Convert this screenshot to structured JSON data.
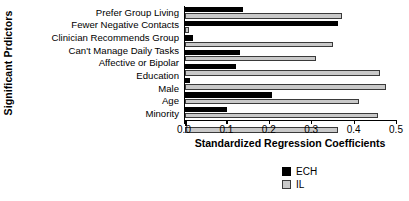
{
  "chart_data": {
    "type": "bar",
    "orientation": "horizontal",
    "title": "",
    "xlabel": "Standardized Regression Coefficients",
    "ylabel": "Significant Prdictors",
    "xlim": [
      0.0,
      0.5
    ],
    "xticks": [
      "0.0",
      "0.1",
      "0.2",
      "0.3",
      "0.4",
      "0.5"
    ],
    "xtick_values": [
      0.0,
      0.1,
      0.2,
      0.3,
      0.4,
      0.5
    ],
    "grid": false,
    "legend_position": "bottom-right",
    "categories": [
      "Prefer Group Living",
      "Fewer Negative Contacts",
      "Clinician Recommends Group",
      "Can't Manage Daily Tasks",
      "Affective or Bipolar",
      "Education",
      "Male",
      "Age",
      "Minority"
    ],
    "series": [
      {
        "name": "ECH",
        "color": "#000000",
        "values": [
          0.137,
          0.36,
          0.02,
          0.13,
          0.12,
          0.012,
          0.205,
          0.1,
          0.0
        ]
      },
      {
        "name": "IL",
        "color": "#c9c9c9",
        "values": [
          0.37,
          0.01,
          0.35,
          0.31,
          0.46,
          0.475,
          0.41,
          0.455,
          0.36
        ]
      }
    ]
  },
  "legend": {
    "items": [
      {
        "label": "ECH",
        "color": "#000000"
      },
      {
        "label": "IL",
        "color": "#c9c9c9"
      }
    ]
  }
}
